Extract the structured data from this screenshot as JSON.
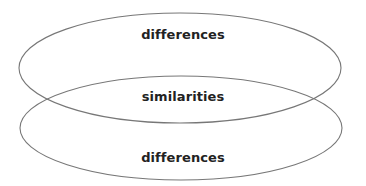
{
  "diagram": {
    "type": "overlapping-ellipses",
    "stroke_color": "#777777",
    "text_color": "#222222",
    "ellipses": [
      {
        "id": "top",
        "label": "differences"
      },
      {
        "id": "bottom",
        "label": "differences"
      }
    ],
    "overlap_label": "similarities"
  }
}
